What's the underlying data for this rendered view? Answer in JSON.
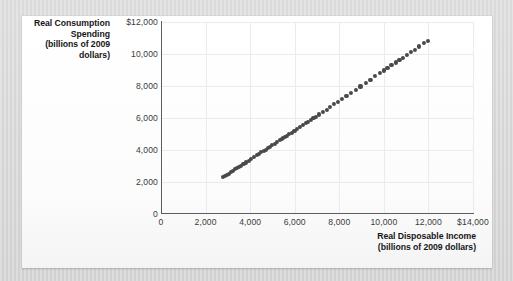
{
  "chart_data": {
    "type": "scatter",
    "title": "",
    "xlabel": "Real Disposable Income (billions of 2009 dollars)",
    "ylabel": "Real Consumption Spending (billions of 2009 dollars)",
    "xlabel_line1": "Real Disposable Income",
    "xlabel_line2": "(billions of 2009 dollars)",
    "ylabel_line1": "Real Consumption",
    "ylabel_line2": "Spending",
    "ylabel_line3": "(billions of 2009",
    "ylabel_line4": "dollars)",
    "xlim": [
      0,
      14000
    ],
    "ylim": [
      0,
      12000
    ],
    "xticks": [
      0,
      2000,
      4000,
      6000,
      8000,
      10000,
      12000,
      14000
    ],
    "yticks": [
      0,
      2000,
      4000,
      6000,
      8000,
      10000,
      12000
    ],
    "xticklabels": [
      "0",
      "2,000",
      "4,000",
      "6,000",
      "8,000",
      "10,000",
      "12,000",
      "$14,000"
    ],
    "yticklabels": [
      "0",
      "2,000",
      "4,000",
      "6,000",
      "8,000",
      "10,000",
      "$12,000"
    ],
    "grid": true,
    "legend": "none",
    "marker_color": "#494949",
    "marker_size_px": 4.1,
    "x": [
      2800,
      2870,
      2950,
      3040,
      3130,
      3230,
      3330,
      3420,
      3500,
      3600,
      3700,
      3810,
      3930,
      4050,
      4180,
      4300,
      4400,
      4500,
      4600,
      4700,
      4790,
      4880,
      4990,
      5100,
      5210,
      5330,
      5420,
      5480,
      5560,
      5660,
      5760,
      5870,
      5990,
      6110,
      6240,
      6380,
      6500,
      6610,
      6720,
      6840,
      6960,
      7100,
      7260,
      7430,
      7600,
      7780,
      7950,
      8130,
      8320,
      8520,
      8730,
      8950,
      9180,
      9400,
      9620,
      9830,
      10000,
      10160,
      10340,
      10530,
      10700,
      10860,
      11020,
      11200,
      11390,
      11590,
      11800,
      11980
    ],
    "y": [
      2320,
      2380,
      2450,
      2530,
      2610,
      2700,
      2790,
      2870,
      2940,
      3030,
      3120,
      3220,
      3330,
      3440,
      3560,
      3670,
      3760,
      3850,
      3940,
      4030,
      4110,
      4190,
      4290,
      4390,
      4490,
      4600,
      4680,
      4740,
      4810,
      4900,
      4990,
      5090,
      5200,
      5310,
      5430,
      5560,
      5670,
      5770,
      5870,
      5980,
      6090,
      6220,
      6370,
      6530,
      6690,
      6860,
      7020,
      7190,
      7370,
      7560,
      7760,
      7970,
      8190,
      8400,
      8610,
      8810,
      8970,
      9120,
      9290,
      9470,
      9630,
      9780,
      9930,
      10100,
      10280,
      10470,
      10670,
      10840
    ]
  }
}
